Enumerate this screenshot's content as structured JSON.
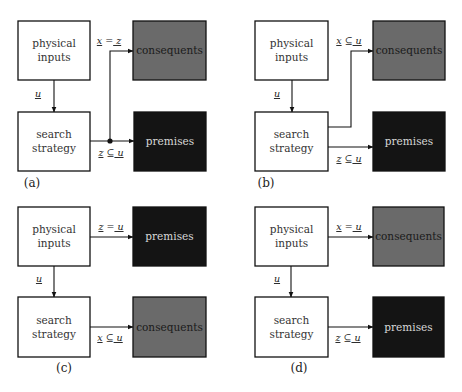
{
  "figure": {
    "width": 462,
    "height": 392,
    "colors": {
      "background": "#ffffff",
      "line": "#111111",
      "white_box_fill": "#ffffff",
      "white_box_text": "#333333",
      "consequents_fill": "#6a6a6a",
      "consequents_text": "#1a1a1a",
      "premises_fill": "#141414",
      "premises_text": "#d8d8d8"
    }
  },
  "panels": [
    {
      "id": "a",
      "label": "(a)",
      "label_pos": [
        32,
        187
      ],
      "boxes": [
        {
          "id": "physical-inputs",
          "lines": [
            "physical",
            "inputs"
          ],
          "x": 18,
          "y": 21,
          "w": 72,
          "h": 59,
          "style": "white"
        },
        {
          "id": "search-strategy",
          "lines": [
            "search",
            "strategy"
          ],
          "x": 18,
          "y": 112,
          "w": 72,
          "h": 59,
          "style": "white"
        },
        {
          "id": "consequents",
          "lines": [
            "consequents"
          ],
          "x": 133,
          "y": 21,
          "w": 73,
          "h": 59,
          "style": "consequents"
        },
        {
          "id": "premises",
          "lines": [
            "premises"
          ],
          "x": 134,
          "y": 112,
          "w": 72,
          "h": 59,
          "style": "premises"
        }
      ],
      "edges": [
        {
          "id": "inputs-to-search",
          "points": [
            [
              54,
              80
            ],
            [
              54,
              112
            ]
          ],
          "arrow": true,
          "label": "u",
          "label_pos": [
            38,
            97
          ],
          "label_underline": "all"
        },
        {
          "id": "search-to-premises",
          "points": [
            [
              90,
              141
            ],
            [
              134,
              141
            ]
          ],
          "arrow": true,
          "label": "z ⊆ u",
          "label_pos": [
            111,
            156
          ],
          "label_underline": "vars"
        },
        {
          "id": "junction-to-consequents",
          "points": [
            [
              110,
              141
            ],
            [
              110,
              51
            ],
            [
              133,
              51
            ]
          ],
          "arrow": true,
          "label": "x = z",
          "label_pos": [
            109,
            44
          ],
          "label_underline": "vars"
        }
      ],
      "junctions": [
        [
          110,
          141
        ]
      ]
    },
    {
      "id": "b",
      "label": "(b)",
      "label_pos": [
        266,
        187
      ],
      "boxes": [
        {
          "id": "physical-inputs",
          "lines": [
            "physical",
            "inputs"
          ],
          "x": 255,
          "y": 21,
          "w": 73,
          "h": 59,
          "style": "white"
        },
        {
          "id": "search-strategy",
          "lines": [
            "search",
            "strategy"
          ],
          "x": 255,
          "y": 112,
          "w": 73,
          "h": 59,
          "style": "white"
        },
        {
          "id": "consequents",
          "lines": [
            "consequents"
          ],
          "x": 373,
          "y": 21,
          "w": 72,
          "h": 59,
          "style": "consequents"
        },
        {
          "id": "premises",
          "lines": [
            "premises"
          ],
          "x": 373,
          "y": 112,
          "w": 72,
          "h": 59,
          "style": "premises"
        }
      ],
      "edges": [
        {
          "id": "inputs-to-search",
          "points": [
            [
              292,
              80
            ],
            [
              292,
              112
            ]
          ],
          "arrow": true,
          "label": "u",
          "label_pos": [
            277,
            97
          ],
          "label_underline": "all"
        },
        {
          "id": "search-to-consequents",
          "points": [
            [
              328,
              127
            ],
            [
              351,
              127
            ],
            [
              351,
              51
            ],
            [
              373,
              51
            ]
          ],
          "arrow": true,
          "label": "x ⊆ u",
          "label_pos": [
            349,
            44
          ],
          "label_underline": "vars"
        },
        {
          "id": "search-to-premises",
          "points": [
            [
              328,
              147
            ],
            [
              373,
              147
            ]
          ],
          "arrow": true,
          "label": "z ⊆ u",
          "label_pos": [
            349,
            162
          ],
          "label_underline": "vars"
        }
      ],
      "junctions": []
    },
    {
      "id": "c",
      "label": "(c)",
      "label_pos": [
        64,
        372
      ],
      "boxes": [
        {
          "id": "physical-inputs",
          "lines": [
            "physical",
            "inputs"
          ],
          "x": 18,
          "y": 207,
          "w": 72,
          "h": 59,
          "style": "white"
        },
        {
          "id": "search-strategy",
          "lines": [
            "search",
            "strategy"
          ],
          "x": 18,
          "y": 297,
          "w": 72,
          "h": 60,
          "style": "white"
        },
        {
          "id": "premises",
          "lines": [
            "premises"
          ],
          "x": 133,
          "y": 207,
          "w": 73,
          "h": 59,
          "style": "premises"
        },
        {
          "id": "consequents",
          "lines": [
            "consequents"
          ],
          "x": 133,
          "y": 297,
          "w": 73,
          "h": 60,
          "style": "consequents"
        }
      ],
      "edges": [
        {
          "id": "inputs-to-search",
          "points": [
            [
              54,
              266
            ],
            [
              54,
              297
            ]
          ],
          "arrow": true,
          "label": "u",
          "label_pos": [
            39,
            282
          ],
          "label_underline": "all"
        },
        {
          "id": "inputs-to-premises",
          "points": [
            [
              90,
              237
            ],
            [
              133,
              237
            ]
          ],
          "arrow": true,
          "label": "z = u",
          "label_pos": [
            111,
            230
          ],
          "label_underline": "vars"
        },
        {
          "id": "search-to-consequents",
          "points": [
            [
              90,
              327
            ],
            [
              133,
              327
            ]
          ],
          "arrow": true,
          "label": "x ⊆ u",
          "label_pos": [
            110,
            341
          ],
          "label_underline": "vars"
        }
      ],
      "junctions": []
    },
    {
      "id": "d",
      "label": "(d)",
      "label_pos": [
        299,
        372
      ],
      "boxes": [
        {
          "id": "physical-inputs",
          "lines": [
            "physical",
            "inputs"
          ],
          "x": 255,
          "y": 207,
          "w": 73,
          "h": 59,
          "style": "white"
        },
        {
          "id": "search-strategy",
          "lines": [
            "search",
            "strategy"
          ],
          "x": 255,
          "y": 297,
          "w": 73,
          "h": 60,
          "style": "white"
        },
        {
          "id": "consequents",
          "lines": [
            "consequents"
          ],
          "x": 373,
          "y": 207,
          "w": 71,
          "h": 59,
          "style": "consequents"
        },
        {
          "id": "premises",
          "lines": [
            "premises"
          ],
          "x": 373,
          "y": 297,
          "w": 71,
          "h": 60,
          "style": "premises"
        }
      ],
      "edges": [
        {
          "id": "inputs-to-search",
          "points": [
            [
              291,
              266
            ],
            [
              291,
              297
            ]
          ],
          "arrow": true,
          "label": "u",
          "label_pos": [
            277,
            282
          ],
          "label_underline": "all"
        },
        {
          "id": "inputs-to-consequents",
          "points": [
            [
              328,
              237
            ],
            [
              373,
              237
            ]
          ],
          "arrow": true,
          "label": "x = u",
          "label_pos": [
            349,
            230
          ],
          "label_underline": "vars"
        },
        {
          "id": "search-to-premises",
          "points": [
            [
              328,
              327
            ],
            [
              373,
              327
            ]
          ],
          "arrow": true,
          "label": "z ⊆ u",
          "label_pos": [
            348,
            341
          ],
          "label_underline": "vars"
        }
      ],
      "junctions": []
    }
  ]
}
